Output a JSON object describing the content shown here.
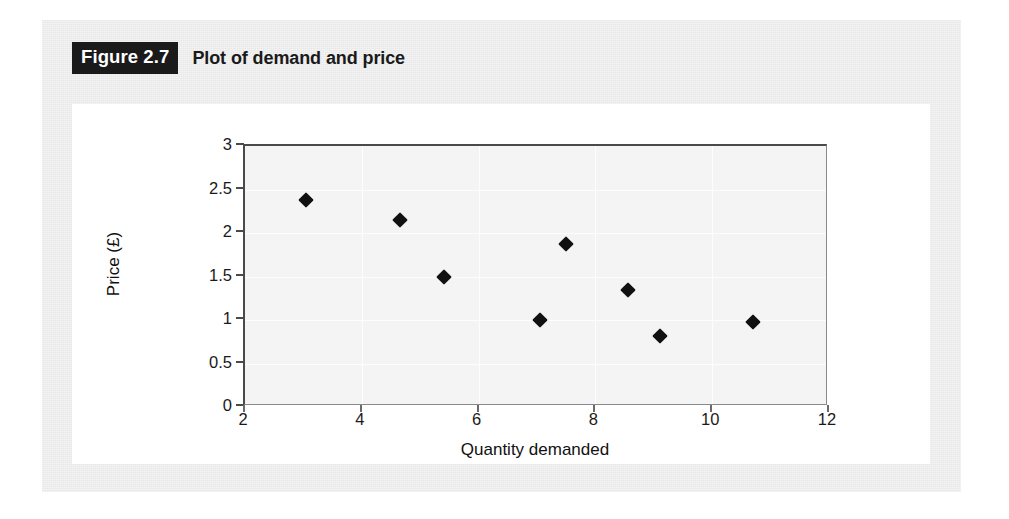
{
  "figure": {
    "tag": "Figure 2.7",
    "caption": "Plot of demand and price"
  },
  "colors": {
    "panel_background": "#e8e8e8",
    "card_background": "#ffffff",
    "plot_background": "#f4f4f4",
    "tag_background": "#1a1a1a",
    "tag_text": "#ffffff",
    "marker": "#111111",
    "axis": "#4a4a4a",
    "gridline": "#fdfdfd"
  },
  "chart_data": {
    "type": "scatter",
    "title": "Plot of demand and price",
    "xlabel": "Quantity demanded",
    "ylabel": "Price (£)",
    "xlim": [
      2,
      12
    ],
    "ylim": [
      0,
      3
    ],
    "xticks": [
      2,
      4,
      6,
      8,
      10,
      12
    ],
    "xtick_labels": [
      "2",
      "4",
      "6",
      "8",
      "10",
      "12"
    ],
    "yticks": [
      0,
      0.5,
      1,
      1.5,
      2,
      2.5,
      3
    ],
    "ytick_labels": [
      "0",
      "0.5",
      "1",
      "1.5",
      "2",
      "2.5",
      "3"
    ],
    "grid": true,
    "grid_axes": "both",
    "legend": false,
    "marker_style": "filled-diamond",
    "marker_color": "#111111",
    "points": [
      {
        "x": 3.05,
        "y": 2.38
      },
      {
        "x": 4.65,
        "y": 2.15
      },
      {
        "x": 5.4,
        "y": 1.49
      },
      {
        "x": 7.05,
        "y": 1.0
      },
      {
        "x": 7.5,
        "y": 1.87
      },
      {
        "x": 8.55,
        "y": 1.35
      },
      {
        "x": 9.1,
        "y": 0.82
      },
      {
        "x": 10.7,
        "y": 0.98
      }
    ]
  }
}
